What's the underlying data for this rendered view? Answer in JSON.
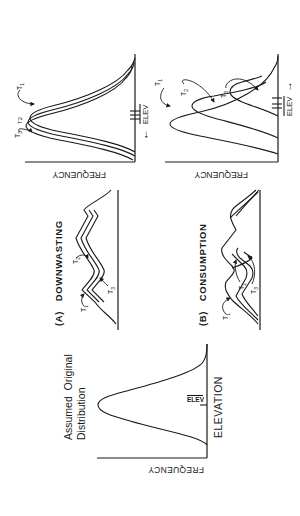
{
  "figure": {
    "orientation": "rotated -90 degrees on page",
    "original_panel": {
      "title_line1": "Assumed  Original",
      "title_line2": "Distribution",
      "y_axis_label": "FREQUENCY",
      "x_axis_label": "ELEVATION",
      "mean_tick_label": "ELEV"
    },
    "panel_a": {
      "label": "(A)   DOWNWASTING",
      "curve_labels": [
        "T1",
        "T2",
        "T3"
      ],
      "result": {
        "y_axis_label": "FREQUENCY",
        "mean_label": "ELEV",
        "mean_shift": "←",
        "curve_labels": [
          "T1",
          "T2",
          "T3"
        ]
      }
    },
    "panel_b": {
      "label": "(B)   CONSUMPTION",
      "curve_labels": [
        "T1",
        "T2",
        "T3"
      ],
      "result": {
        "y_axis_label": "FREQUENCY",
        "mean_label": "ELEV",
        "mean_shift": "→",
        "curve_labels": [
          "T1",
          "T2",
          "T3"
        ]
      }
    },
    "colors": {
      "ink": "#1a1a1a",
      "paper": "#ffffff"
    }
  }
}
